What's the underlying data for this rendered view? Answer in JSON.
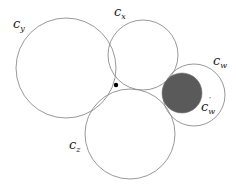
{
  "figure": {
    "width": 236,
    "height": 188,
    "background": "#ffffff",
    "stroke_color": "#8c8c8c",
    "fill_dark": "#5a5a5a",
    "dot_color": "#000000"
  },
  "circles": [
    {
      "id": "c_y",
      "cx": 66,
      "cy": 68,
      "r": 50,
      "filled": false
    },
    {
      "id": "c_x",
      "cx": 143,
      "cy": 55,
      "r": 35,
      "filled": false
    },
    {
      "id": "c_z",
      "cx": 130,
      "cy": 134,
      "r": 45,
      "filled": false
    },
    {
      "id": "c_w",
      "cx": 194,
      "cy": 95,
      "r": 31,
      "filled": false
    },
    {
      "id": "c_w_prime",
      "cx": 182,
      "cy": 93,
      "r": 20,
      "filled": true
    }
  ],
  "point": {
    "cx": 116,
    "cy": 85,
    "r": 2.2
  },
  "labels": {
    "c_y": {
      "base": "c",
      "sub": "y"
    },
    "c_x": {
      "base": "c",
      "sub": "x"
    },
    "c_w": {
      "base": "c",
      "sub": "w"
    },
    "c_w_prime": {
      "base": "c",
      "sub": "w",
      "sup": "′"
    },
    "c_z": {
      "base": "c",
      "sub": "z"
    }
  }
}
